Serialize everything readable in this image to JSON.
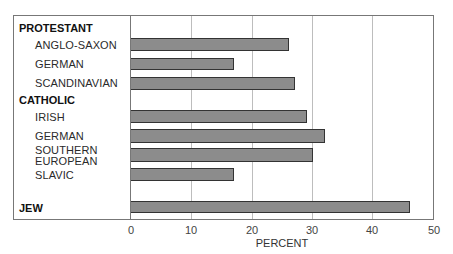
{
  "chart_data": {
    "type": "bar",
    "orientation": "horizontal",
    "title": "",
    "xlabel": "PERCENT",
    "ylabel": "",
    "xlim": [
      0,
      50
    ],
    "xticks": [
      "0",
      "10",
      "20",
      "30",
      "40",
      "50"
    ],
    "grid": true,
    "legend": null,
    "groups": [
      {
        "name": "PROTESTANT",
        "categories": [
          "ANGLO-SAXON",
          "GERMAN",
          "SCANDINAVIAN"
        ],
        "values": [
          26,
          17,
          27
        ]
      },
      {
        "name": "CATHOLIC",
        "categories": [
          "IRISH",
          "GERMAN",
          "SOUTHERN EUROPEAN",
          "SLAVIC"
        ],
        "values": [
          29,
          32,
          30,
          17
        ]
      },
      {
        "name": "JEW",
        "categories": [
          "JEW"
        ],
        "values": [
          46
        ]
      }
    ],
    "categories": [
      "PROTESTANT ANGLO-SAXON",
      "PROTESTANT GERMAN",
      "PROTESTANT SCANDINAVIAN",
      "CATHOLIC IRISH",
      "CATHOLIC GERMAN",
      "CATHOLIC SOUTHERN EUROPEAN",
      "CATHOLIC SLAVIC",
      "JEW"
    ],
    "values": [
      26,
      17,
      27,
      29,
      32,
      30,
      17,
      46
    ],
    "bar_color": "#8c8c8c"
  },
  "labels": {
    "protestant": "PROTESTANT",
    "anglo_saxon": "ANGLO-SAXON",
    "german_p": "GERMAN",
    "scandinavian": "SCANDINAVIAN",
    "catholic": "CATHOLIC",
    "irish": "IRISH",
    "german_c": "GERMAN",
    "southern": "SOUTHERN",
    "european": "EUROPEAN",
    "slavic": "SLAVIC",
    "jew": "JEW"
  },
  "axis": {
    "ticks": [
      "0",
      "10",
      "20",
      "30",
      "40",
      "50"
    ],
    "label": "PERCENT"
  }
}
